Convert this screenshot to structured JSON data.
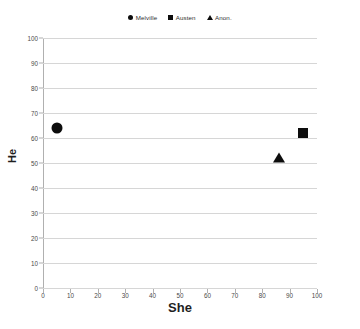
{
  "chart_data": {
    "type": "scatter",
    "title": "",
    "xlabel": "She",
    "ylabel": "He",
    "xlim": [
      0,
      100
    ],
    "ylim": [
      0,
      100
    ],
    "xticks": [
      0,
      10,
      20,
      30,
      40,
      50,
      60,
      70,
      80,
      90,
      100
    ],
    "yticks": [
      0,
      10,
      20,
      30,
      40,
      50,
      60,
      70,
      80,
      90,
      100
    ],
    "grid": "horizontal",
    "legend_position": "top-center",
    "marker_color": "#0d0d0d",
    "gridline_color": "#d6d6d6",
    "series": [
      {
        "name": "Melville",
        "marker": "circle",
        "points": [
          {
            "x": 5,
            "y": 64
          }
        ]
      },
      {
        "name": "Austen",
        "marker": "square",
        "points": [
          {
            "x": 95,
            "y": 62
          }
        ]
      },
      {
        "name": "Anon.",
        "marker": "triangle",
        "points": [
          {
            "x": 86,
            "y": 52
          }
        ]
      }
    ]
  },
  "legend": {
    "entries": [
      {
        "label": "Melville",
        "marker": "circle"
      },
      {
        "label": "Austen",
        "marker": "square"
      },
      {
        "label": "Anon.",
        "marker": "triangle"
      }
    ]
  },
  "axes": {
    "x_title": "She",
    "y_title": "He",
    "x_tick_labels": [
      "0",
      "10",
      "20",
      "30",
      "40",
      "50",
      "60",
      "70",
      "80",
      "90",
      "100"
    ],
    "y_tick_labels": [
      "0",
      "10",
      "20",
      "30",
      "40",
      "50",
      "60",
      "70",
      "80",
      "90",
      "100"
    ]
  }
}
